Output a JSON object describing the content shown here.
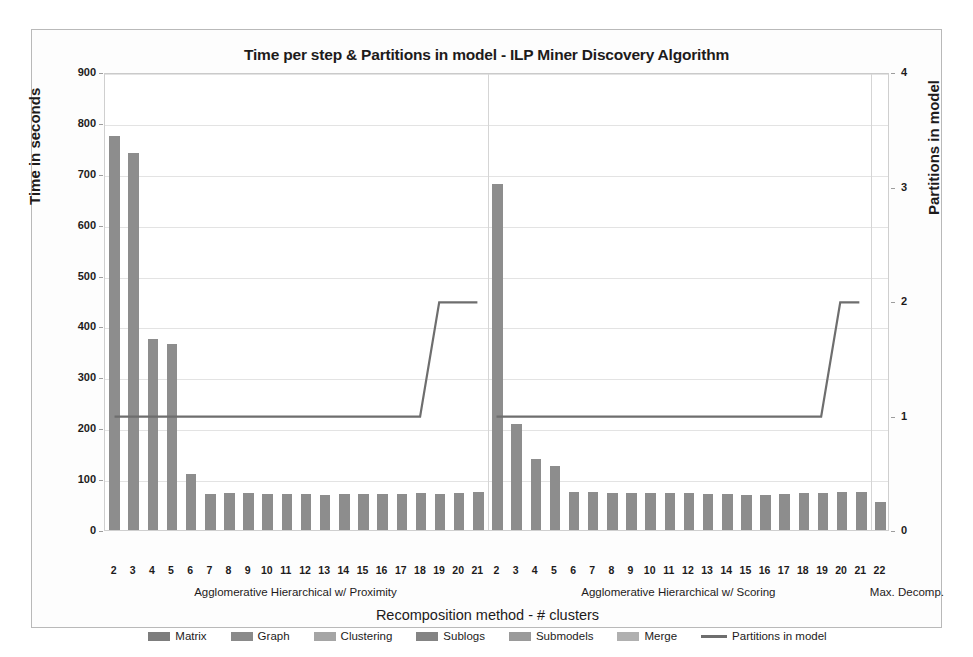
{
  "chart_data": {
    "type": "bar",
    "title": "Time per step & Partitions in model - ILP Miner Discovery Algorithm",
    "xlabel": "Recomposition method - # clusters",
    "ylabel": "Time in seconds",
    "y2label": "Partitions in model",
    "ylim": [
      0,
      900
    ],
    "y2lim": [
      0,
      4
    ],
    "ytick_labels": [
      "0",
      "100",
      "200",
      "300",
      "400",
      "500",
      "600",
      "700",
      "800",
      "900"
    ],
    "y2tick_labels": [
      "0",
      "1",
      "2",
      "3",
      "4"
    ],
    "grid": true,
    "legend_position": "bottom",
    "categories": [
      "2",
      "3",
      "4",
      "5",
      "6",
      "7",
      "8",
      "9",
      "10",
      "11",
      "12",
      "13",
      "14",
      "15",
      "16",
      "17",
      "18",
      "19",
      "20",
      "21",
      "2",
      "3",
      "4",
      "5",
      "6",
      "7",
      "8",
      "9",
      "10",
      "11",
      "12",
      "13",
      "14",
      "15",
      "16",
      "17",
      "18",
      "19",
      "20",
      "21",
      "22"
    ],
    "group_labels": [
      {
        "text": "Agglomerative Hierarchical w/ Proximity",
        "start": 0,
        "end": 19
      },
      {
        "text": "Agglomerative Hierarchical w/ Scoring",
        "start": 20,
        "end": 39
      },
      {
        "text": "Max. Decomp.",
        "start": 40,
        "end": 40
      }
    ],
    "series": [
      {
        "name": "Time per step (stacked total)",
        "axis": "left",
        "values": [
          775,
          740,
          375,
          365,
          110,
          70,
          72,
          72,
          70,
          71,
          70,
          68,
          70,
          71,
          70,
          71,
          72,
          71,
          72,
          74,
          680,
          208,
          140,
          125,
          74,
          75,
          73,
          73,
          73,
          72,
          72,
          70,
          70,
          68,
          68,
          70,
          72,
          73,
          74,
          74,
          55
        ]
      },
      {
        "name": "Partitions in model",
        "axis": "right",
        "values": [
          1,
          1,
          1,
          1,
          1,
          1,
          1,
          1,
          1,
          1,
          1,
          1,
          1,
          1,
          1,
          1,
          1,
          2,
          2,
          2,
          1,
          1,
          1,
          1,
          1,
          1,
          1,
          1,
          1,
          1,
          1,
          1,
          1,
          1,
          1,
          1,
          1,
          1,
          2,
          2,
          2
        ]
      }
    ],
    "legend": [
      {
        "label": "Matrix",
        "type": "swatch",
        "color": "#7d7d7d"
      },
      {
        "label": "Graph",
        "type": "swatch",
        "color": "#8a8a8a"
      },
      {
        "label": "Clustering",
        "type": "swatch",
        "color": "#a5a5a5"
      },
      {
        "label": "Sublogs",
        "type": "swatch",
        "color": "#848484"
      },
      {
        "label": "Submodels",
        "type": "swatch",
        "color": "#9a9a9a"
      },
      {
        "label": "Merge",
        "type": "swatch",
        "color": "#b0b0b0"
      },
      {
        "label": "Partitions in model",
        "type": "line",
        "color": "#6e6e6e"
      }
    ],
    "colors": {
      "bar": "#8d8d8d",
      "line": "#6e6e6e",
      "grid": "#e3e3e3",
      "axis": "#cfcfcf",
      "text": "#231f20",
      "background": "#ffffff"
    }
  }
}
